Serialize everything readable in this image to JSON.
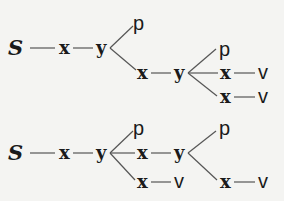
{
  "diagram": {
    "title": "",
    "trees": [
      {
        "name": "tree-1",
        "nodes": [
          {
            "id": "S",
            "label": "S",
            "style": "italic-serif",
            "x": 8,
            "y": 55
          },
          {
            "id": "x1",
            "label": "x",
            "style": "bold-serif",
            "x": 59,
            "y": 54
          },
          {
            "id": "y1",
            "label": "y",
            "style": "bold-serif",
            "x": 96,
            "y": 54
          },
          {
            "id": "p1",
            "label": "p",
            "style": "sans",
            "x": 133,
            "y": 30
          },
          {
            "id": "x2",
            "label": "x",
            "style": "bold-serif",
            "x": 137,
            "y": 79
          },
          {
            "id": "y2",
            "label": "y",
            "style": "bold-serif",
            "x": 174,
            "y": 79
          },
          {
            "id": "p2",
            "label": "p",
            "style": "sans",
            "x": 219,
            "y": 56
          },
          {
            "id": "x3",
            "label": "x",
            "style": "bold-serif",
            "x": 220,
            "y": 79
          },
          {
            "id": "v1",
            "label": "v",
            "style": "sans",
            "x": 258,
            "y": 79
          },
          {
            "id": "x4",
            "label": "x",
            "style": "bold-serif",
            "x": 220,
            "y": 103
          },
          {
            "id": "v2",
            "label": "v",
            "style": "sans",
            "x": 258,
            "y": 103
          }
        ],
        "edges": [
          [
            "S",
            "x1"
          ],
          [
            "x1",
            "y1"
          ],
          [
            "y1",
            "p1"
          ],
          [
            "y1",
            "x2"
          ],
          [
            "x2",
            "y2"
          ],
          [
            "y2",
            "p2"
          ],
          [
            "y2",
            "x3"
          ],
          [
            "x3",
            "v1"
          ],
          [
            "y2",
            "x4"
          ],
          [
            "x4",
            "v2"
          ]
        ]
      },
      {
        "name": "tree-2",
        "nodes": [
          {
            "id": "S",
            "label": "S",
            "style": "italic-serif",
            "x": 8,
            "y": 160
          },
          {
            "id": "x1",
            "label": "x",
            "style": "bold-serif",
            "x": 59,
            "y": 159
          },
          {
            "id": "y1",
            "label": "y",
            "style": "bold-serif",
            "x": 96,
            "y": 159
          },
          {
            "id": "p1",
            "label": "p",
            "style": "sans",
            "x": 133,
            "y": 135
          },
          {
            "id": "x2",
            "label": "x",
            "style": "bold-serif",
            "x": 137,
            "y": 159
          },
          {
            "id": "y2",
            "label": "y",
            "style": "bold-serif",
            "x": 174,
            "y": 159
          },
          {
            "id": "x3",
            "label": "x",
            "style": "bold-serif",
            "x": 137,
            "y": 188
          },
          {
            "id": "v1",
            "label": "v",
            "style": "sans",
            "x": 174,
            "y": 188
          },
          {
            "id": "p2",
            "label": "p",
            "style": "sans",
            "x": 219,
            "y": 135
          },
          {
            "id": "x4",
            "label": "x",
            "style": "bold-serif",
            "x": 220,
            "y": 188
          },
          {
            "id": "v2",
            "label": "v",
            "style": "sans",
            "x": 258,
            "y": 188
          }
        ],
        "edges": [
          [
            "S",
            "x1"
          ],
          [
            "x1",
            "y1"
          ],
          [
            "y1",
            "p1"
          ],
          [
            "y1",
            "x2"
          ],
          [
            "y1",
            "x3"
          ],
          [
            "x2",
            "y2"
          ],
          [
            "x3",
            "v1"
          ],
          [
            "y2",
            "p2"
          ],
          [
            "y2",
            "x4"
          ],
          [
            "x4",
            "v2"
          ]
        ]
      }
    ]
  }
}
